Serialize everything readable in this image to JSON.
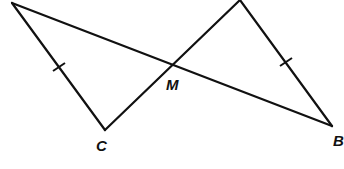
{
  "diagram": {
    "type": "geometry-figure",
    "labels": {
      "M": "M",
      "C": "C",
      "B": "B"
    },
    "points": {
      "A_topleft": {
        "x": 12,
        "y": 3,
        "label": ""
      },
      "C": {
        "x": 105,
        "y": 130,
        "label": "C"
      },
      "M": {
        "x": 172,
        "y": 63,
        "label": "M"
      },
      "D_top": {
        "x": 240,
        "y": 0,
        "label": ""
      },
      "B": {
        "x": 332,
        "y": 126,
        "label": "B"
      }
    },
    "segments": [
      {
        "from": "A_topleft",
        "to": "B",
        "via": "M"
      },
      {
        "from": "A_topleft",
        "to": "C",
        "tick_marks": 1
      },
      {
        "from": "C",
        "to": "D_top",
        "via": "M"
      },
      {
        "from": "D_top",
        "to": "B",
        "tick_marks": 1
      }
    ],
    "congruent_segments": [
      [
        "A_topleft-C",
        "D_top-B"
      ]
    ],
    "stroke_color": "#111111",
    "background_color": "#ffffff"
  }
}
